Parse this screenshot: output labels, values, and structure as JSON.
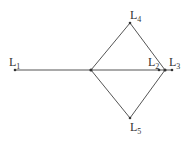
{
  "diagram": {
    "nodes": [
      {
        "id": "L1",
        "label": "L",
        "sub": "1",
        "x": 15,
        "y": 70,
        "lx": 9,
        "ly": 66
      },
      {
        "id": "C",
        "label": "",
        "sub": "",
        "x": 91,
        "y": 70
      },
      {
        "id": "L4",
        "label": "L",
        "sub": "4",
        "x": 130,
        "y": 23,
        "lx": 130,
        "ly": 19
      },
      {
        "id": "L5",
        "label": "L",
        "sub": "5",
        "x": 130,
        "y": 118,
        "lx": 130,
        "ly": 131
      },
      {
        "id": "R",
        "label": "",
        "sub": "",
        "x": 165,
        "y": 70
      },
      {
        "id": "L2",
        "label": "L",
        "sub": "2",
        "x": 159,
        "y": 70,
        "lx": 148,
        "ly": 66
      },
      {
        "id": "L3",
        "label": "L",
        "sub": "3",
        "x": 172,
        "y": 70,
        "lx": 169,
        "ly": 66
      }
    ],
    "edges": [
      [
        "L1",
        "C"
      ],
      [
        "C",
        "L3"
      ],
      [
        "C",
        "L4"
      ],
      [
        "C",
        "L5"
      ],
      [
        "L4",
        "R"
      ],
      [
        "L5",
        "R"
      ]
    ]
  }
}
